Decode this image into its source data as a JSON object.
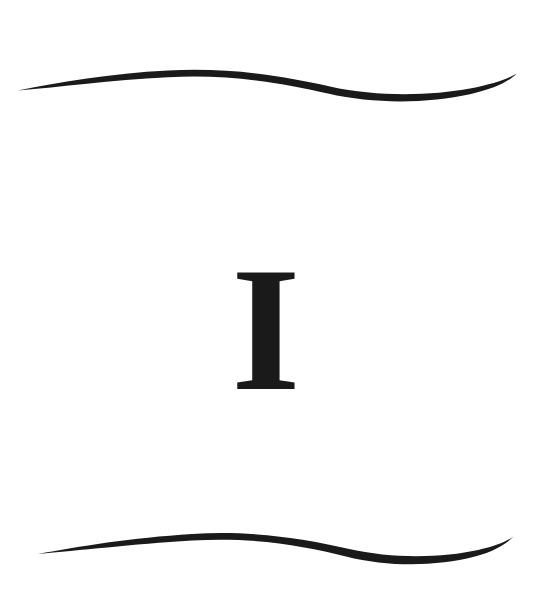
{
  "plate": {
    "width": 547,
    "height": 611,
    "background_color": "#ffffff",
    "ink_color": "#1a1a1a",
    "description": "Ornamental book plate: a single serif capital letter centered between two horizontal S-curve flourish rules"
  },
  "letter": {
    "character": "I",
    "style": "serif-capital",
    "color": "#1a1a1a",
    "center_x": 266,
    "cap_top_y": 263,
    "baseline_y": 389,
    "serif_left_x": 249,
    "serif_right_x": 284,
    "stem_left_x": 255,
    "stem_right_x": 277
  },
  "ornaments": {
    "top_rule": {
      "name": "top-flourish",
      "color": "#1a1a1a",
      "left_tip": {
        "x": 18,
        "y": 90
      },
      "crest": {
        "x": 175,
        "y": 72
      },
      "trough": {
        "x": 372,
        "y": 94
      },
      "right_tip": {
        "x": 516,
        "y": 74
      },
      "max_thickness": 7
    },
    "bottom_rule": {
      "name": "bottom-flourish",
      "color": "#1a1a1a",
      "left_tip": {
        "x": 38,
        "y": 554
      },
      "crest": {
        "x": 205,
        "y": 533
      },
      "trough": {
        "x": 382,
        "y": 556
      },
      "right_tip": {
        "x": 513,
        "y": 537
      },
      "max_thickness": 7
    }
  }
}
